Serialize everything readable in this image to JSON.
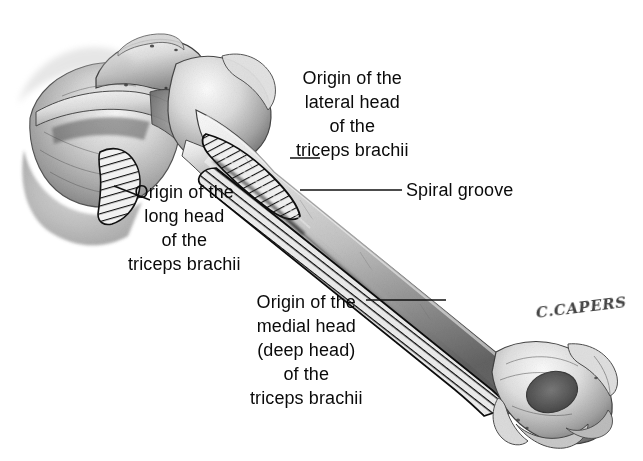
{
  "figure": {
    "background_color": "#ffffff",
    "ink_color": "#0a0a0a",
    "width": 643,
    "height": 461
  },
  "labels": {
    "lateral_head": {
      "name": "Origin of the lateral head of the triceps brachii",
      "lines": [
        "Origin of the",
        "lateral head",
        "of the",
        "triceps brachii"
      ]
    },
    "long_head": {
      "name": "Origin of the long head of the triceps brachii",
      "lines": [
        "Origin of the",
        "long head",
        "of the",
        "triceps brachii"
      ]
    },
    "spiral_groove": {
      "name": "Spiral groove",
      "lines": [
        "Spiral groove"
      ]
    },
    "medial_head": {
      "name": "Origin of the medial head (deep head) of the triceps brachii",
      "lines": [
        "Origin of the",
        "medial head",
        "(deep head)",
        "of the",
        "triceps brachii"
      ]
    }
  },
  "signature": {
    "text": "C.CAPERS"
  },
  "anatomy": {
    "bones": [
      "scapula",
      "humerus"
    ],
    "structures": [
      "acromion process",
      "spine of scapula",
      "glenoid cavity",
      "infraglenoid tubercle",
      "head of humerus",
      "greater tubercle",
      "surgical neck",
      "shaft of humerus",
      "spiral groove",
      "lateral epicondyle",
      "medial epicondyle",
      "olecranon fossa",
      "trochlea"
    ],
    "origin_patches": [
      {
        "id": "long-head-patch",
        "label": "infraglenoid tubercle — long head origin",
        "hatch": "diagonal"
      },
      {
        "id": "lateral-head-patch",
        "label": "proximal posterolateral shaft — lateral head origin",
        "hatch": "diagonal"
      },
      {
        "id": "medial-head-patch",
        "label": "posterior shaft below spiral groove — medial (deep) head origin",
        "hatch": "perpendicular"
      }
    ]
  }
}
